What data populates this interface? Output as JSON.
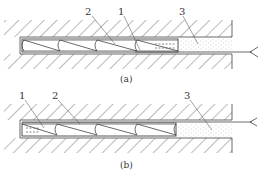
{
  "figure": {
    "panels": [
      {
        "id": "a",
        "caption": "(a)",
        "labels": [
          {
            "text": "2",
            "meaning": "cone element"
          },
          {
            "text": "1",
            "meaning": "end component"
          },
          {
            "text": "3",
            "meaning": "fill material"
          }
        ]
      },
      {
        "id": "b",
        "caption": "(b)",
        "labels": [
          {
            "text": "1",
            "meaning": "end component"
          },
          {
            "text": "2",
            "meaning": "cone element"
          },
          {
            "text": "3",
            "meaning": "fill material"
          }
        ]
      }
    ],
    "colors": {
      "line": "#444444",
      "hatch": "#666666",
      "stipple": "#bbbbbb",
      "background": "#ffffff"
    }
  }
}
